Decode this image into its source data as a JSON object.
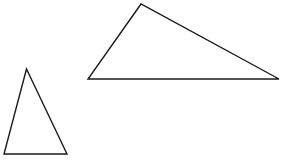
{
  "diagram": {
    "background": "#ffffff",
    "stroke_color": "#1a1a1a",
    "shapes": [
      {
        "name": "large-triangle",
        "type": "triangle",
        "points": "141,4 88,79 279,79"
      },
      {
        "name": "small-triangle",
        "type": "triangle",
        "points": "26.5,69 4,154 67,154"
      }
    ]
  }
}
